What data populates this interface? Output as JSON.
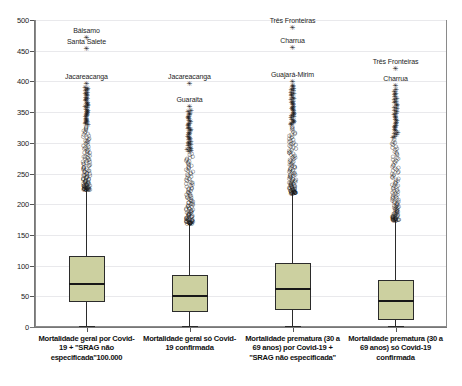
{
  "chart_data": {
    "type": "box",
    "title": "",
    "xlabel": "",
    "ylabel": "",
    "ylim": [
      0,
      500
    ],
    "ytick_step": 50,
    "yticks": [
      "0",
      "50",
      "100",
      "150",
      "200",
      "250",
      "300",
      "350",
      "400",
      "450",
      "500"
    ],
    "grid": true,
    "legend": "none",
    "box_fill_color": "#ccd0a0",
    "box_line_color": "#2b2b2b",
    "categories": [
      "Mortalidade geral por Covid-19 + \"SRAG não especificada\"100.000",
      "Mortalidade geral só Covid-19 confirmada",
      "Mortalidade prematura (30 a 69 anos) por Covid-19 + \"SRAG não especificada\"",
      "Mortalidade prematura (30 a 69 anos) só Covid-19 confirmada"
    ],
    "boxes": [
      {
        "name": "Mortalidade geral por Covid-19 + SRAG não especificada",
        "min": 1,
        "q1": 40,
        "median": 70,
        "q3": 115,
        "upper_whisker": 225,
        "outlier_labels": [
          {
            "text": "Bálsamo",
            "value": 470
          },
          {
            "text": "Santa Salete",
            "value": 452
          },
          {
            "text": "Jacareacanga",
            "value": 396
          }
        ]
      },
      {
        "name": "Mortalidade geral só Covid-19 confirmada",
        "min": 1,
        "q1": 25,
        "median": 50,
        "q3": 84,
        "upper_whisker": 170,
        "outlier_labels": [
          {
            "text": "Jacareacanga",
            "value": 396
          },
          {
            "text": "Guaraita",
            "value": 358
          }
        ]
      },
      {
        "name": "Mortalidade prematura (30 a 69 anos) por Covid-19 + SRAG não especificada",
        "min": 1,
        "q1": 28,
        "median": 62,
        "q3": 104,
        "upper_whisker": 219,
        "outlier_labels": [
          {
            "text": "Três Fronteiras",
            "value": 487
          },
          {
            "text": "Charrua",
            "value": 455
          },
          {
            "text": "Guajará-Mirim",
            "value": 399
          }
        ]
      },
      {
        "name": "Mortalidade prematura (30 a 69 anos) só Covid-19 confirmada",
        "min": 1,
        "q1": 12,
        "median": 43,
        "q3": 77,
        "upper_whisker": 175,
        "outlier_labels": [
          {
            "text": "Três Fronteiras",
            "value": 420
          },
          {
            "text": "Charrua",
            "value": 392
          }
        ]
      }
    ]
  }
}
